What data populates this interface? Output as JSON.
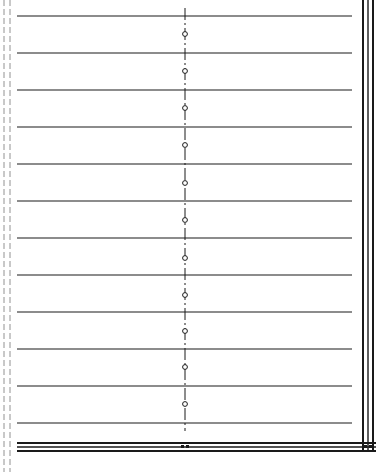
{
  "drawing": {
    "width": 376,
    "height": 472,
    "ink_color": "#1a1a1a",
    "background": "#ffffff",
    "horizontal_lines": {
      "x_start": 17,
      "x_end": 352,
      "y_positions": [
        16,
        53,
        90,
        127,
        164,
        201,
        238,
        275,
        312,
        349,
        386,
        423
      ]
    },
    "center_axis": {
      "x": 185,
      "y_start": 8,
      "y_end": 431,
      "style": "dash-dot"
    },
    "circles": {
      "x": 185,
      "radius": 2.4,
      "y_positions": [
        34,
        71,
        108,
        145,
        183,
        220,
        258,
        295,
        331,
        367,
        404
      ]
    },
    "left_margin_lines": [
      {
        "x": 4,
        "y_start": 0,
        "y_end": 472,
        "style": "dashed"
      },
      {
        "x": 10,
        "y_start": 0,
        "y_end": 472,
        "style": "dashed"
      }
    ],
    "right_border": {
      "x_positions": [
        363,
        368,
        373
      ],
      "y_start": 0,
      "y_end": 452
    },
    "bottom_border": {
      "x_start": 17,
      "x_end": 376,
      "y_positions": [
        443,
        447,
        451
      ]
    }
  }
}
